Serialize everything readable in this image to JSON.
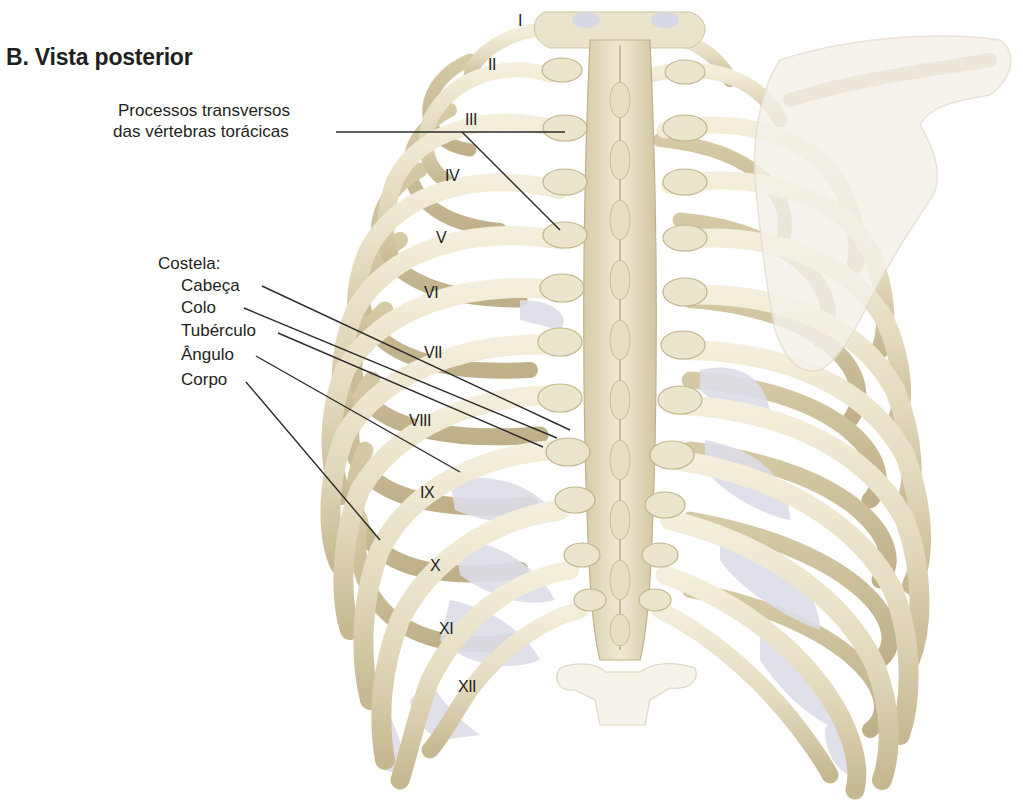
{
  "figure": {
    "title": "B. Vista posterior",
    "colors": {
      "bone_light": "#ede7d2",
      "bone_mid": "#ddd3b6",
      "bone_shadow": "#b9ab86",
      "cartilage": "#dcdde8",
      "scapula": "#f3f0e8",
      "leader_line": "#2b2b2b",
      "text": "#231f20",
      "background": "#ffffff"
    }
  },
  "labels": {
    "transverse_processes_line1": "Processos transversos",
    "transverse_processes_line2": "das vértebras torácicas",
    "rib_heading": "Costela:",
    "rib_parts": [
      {
        "label": "Cabeça"
      },
      {
        "label": "Colo"
      },
      {
        "label": "Tubérculo"
      },
      {
        "label": "Ângulo"
      },
      {
        "label": "Corpo"
      }
    ]
  },
  "ribs": [
    {
      "numeral": "I"
    },
    {
      "numeral": "II"
    },
    {
      "numeral": "III"
    },
    {
      "numeral": "IV"
    },
    {
      "numeral": "V"
    },
    {
      "numeral": "VI"
    },
    {
      "numeral": "VII"
    },
    {
      "numeral": "VIII"
    },
    {
      "numeral": "IX"
    },
    {
      "numeral": "X"
    },
    {
      "numeral": "XI"
    },
    {
      "numeral": "XII"
    }
  ]
}
